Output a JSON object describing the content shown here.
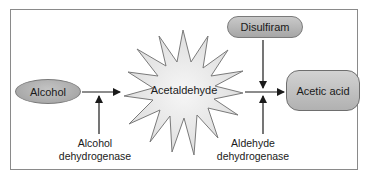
{
  "diagram": {
    "nodes": {
      "alcohol": "Alcohol",
      "acetaldehyde": "Acetaldehyde",
      "acetic_acid": "Acetic acid",
      "disulfiram": "Disulfiram"
    },
    "enzymes": {
      "alcohol_dehydrogenase": {
        "line1": "Alcohol",
        "line2": "dehydrogenase"
      },
      "aldehyde_dehydrogenase": {
        "line1": "Aldehyde",
        "line2": "dehydrogenase"
      }
    },
    "edges": [
      {
        "from": "Alcohol",
        "to": "Acetaldehyde",
        "catalyst": "Alcohol dehydrogenase"
      },
      {
        "from": "Acetaldehyde",
        "to": "Acetic acid",
        "catalyst": "Aldehyde dehydrogenase"
      },
      {
        "from": "Disulfiram",
        "to": "Acetaldehyde → Acetic acid step",
        "type": "inhibitor"
      }
    ],
    "colors": {
      "node_fill": "#b0b0b0",
      "starburst_fill": "#ebebeb",
      "stroke": "#333333",
      "frame": "#8a8a8a"
    }
  }
}
